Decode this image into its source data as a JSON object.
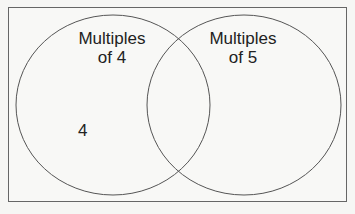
{
  "diagram": {
    "type": "venn",
    "sets": [
      {
        "name": "Multiples of 4",
        "label_line1": "Multiples",
        "label_line2": "of 4"
      },
      {
        "name": "Multiples of 5",
        "label_line1": "Multiples",
        "label_line2": "of 5"
      }
    ],
    "regions": {
      "only_left": [
        "4"
      ],
      "intersection": [],
      "only_right": []
    },
    "colors": {
      "stroke": "#555555",
      "background": "#f6f6f4",
      "frame": "#666666"
    }
  }
}
